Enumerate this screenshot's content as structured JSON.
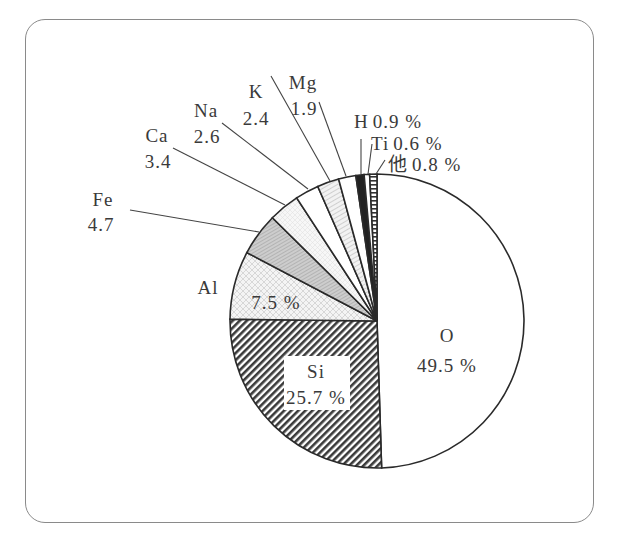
{
  "chart_data": {
    "type": "pie",
    "title": "",
    "unit": "%",
    "categories": [
      "O",
      "Si",
      "Al",
      "Fe",
      "Ca",
      "Na",
      "K",
      "Mg",
      "H",
      "Ti",
      "他"
    ],
    "values": [
      49.5,
      25.7,
      7.5,
      4.7,
      3.4,
      2.6,
      2.4,
      1.9,
      0.9,
      0.6,
      0.8
    ],
    "start_angle_deg": 0,
    "direction": "clockwise from 12 o'clock",
    "legend": "none (leader-line labels)",
    "slices": [
      {
        "name": "O",
        "value": 49.5,
        "pattern": "white"
      },
      {
        "name": "Si",
        "value": 25.7,
        "pattern": "dense-diagonal-hatch"
      },
      {
        "name": "Al",
        "value": 7.5,
        "pattern": "light-crosshatch"
      },
      {
        "name": "Fe",
        "value": 4.7,
        "pattern": "gray-fine-hatch"
      },
      {
        "name": "Ca",
        "value": 3.4,
        "pattern": "light-dotted"
      },
      {
        "name": "Na",
        "value": 2.6,
        "pattern": "white"
      },
      {
        "name": "K",
        "value": 2.4,
        "pattern": "light-diagonal-hatch"
      },
      {
        "name": "Mg",
        "value": 1.9,
        "pattern": "white"
      },
      {
        "name": "H",
        "value": 0.9,
        "pattern": "black"
      },
      {
        "name": "Ti",
        "value": 0.6,
        "pattern": "white"
      },
      {
        "name": "他",
        "value": 0.8,
        "pattern": "horizontal-ladder"
      }
    ]
  },
  "labels": {
    "O": {
      "name": "O",
      "value": "49.5 %"
    },
    "Si": {
      "name": "Si",
      "value": "25.7 %"
    },
    "Al": {
      "name": "Al",
      "value": "7.5 %"
    },
    "Fe": {
      "name": "Fe",
      "value": "4.7"
    },
    "Ca": {
      "name": "Ca",
      "value": "3.4"
    },
    "Na": {
      "name": "Na",
      "value": "2.6"
    },
    "K": {
      "name": "K",
      "value": "2.4"
    },
    "Mg": {
      "name": "Mg",
      "value": "1.9"
    },
    "H": {
      "name": "H",
      "value": "0.9 %"
    },
    "Ti": {
      "name": "Ti",
      "value": "0.6 %"
    },
    "other": {
      "name": "他",
      "value": "0.8 %"
    }
  },
  "colors": {
    "outline": "#2a2a2a",
    "frame": "#8a8a8a",
    "text": "#3a3a3a",
    "fe_fill": "#c8c8c8",
    "si_fill": "#4a4a4a",
    "h_fill": "#222222"
  }
}
